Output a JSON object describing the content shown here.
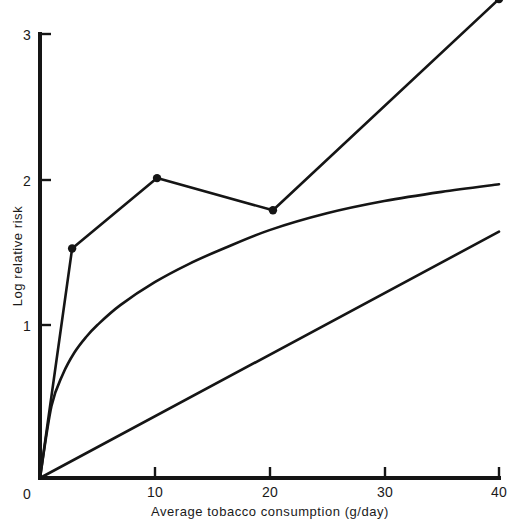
{
  "chart_data": {
    "type": "line",
    "title": "",
    "subtitle": "",
    "xlabel": "Average tobacco consumption (g/day)",
    "ylabel": "Log relative risk",
    "xlim": [
      0,
      40
    ],
    "ylim": [
      0,
      3.2
    ],
    "xticks": [
      0,
      10,
      20,
      30,
      40
    ],
    "yticks": [
      0,
      1,
      2,
      3
    ],
    "xtick_labels": [
      "0",
      "10",
      "20",
      "30",
      "40"
    ],
    "ytick_labels": [
      "0",
      "1",
      "2",
      "3"
    ],
    "grid": false,
    "legend": false,
    "legend_position": "none",
    "annotations": [],
    "series": [
      {
        "name": "observed-data-with-markers",
        "style": "line-with-points",
        "markers": true,
        "x": [
          0,
          2.8,
          10.2,
          20.3,
          40.0
        ],
        "y": [
          0,
          1.5,
          1.96,
          1.75,
          3.13
        ]
      },
      {
        "name": "fitted-curve",
        "style": "smooth-curve",
        "markers": false,
        "x": [
          0,
          1,
          2,
          3,
          4,
          5,
          7,
          10,
          13,
          16,
          20,
          25,
          30,
          35,
          40
        ],
        "y": [
          0,
          0.47,
          0.68,
          0.82,
          0.92,
          1.0,
          1.13,
          1.28,
          1.4,
          1.5,
          1.62,
          1.73,
          1.81,
          1.87,
          1.92
        ]
      },
      {
        "name": "linear-fit",
        "style": "straight-line",
        "markers": false,
        "x": [
          0,
          40
        ],
        "y": [
          0,
          1.61
        ]
      }
    ]
  },
  "figure": {
    "caption": "",
    "background_color": "#ffffff",
    "ink_color": "#151515"
  }
}
